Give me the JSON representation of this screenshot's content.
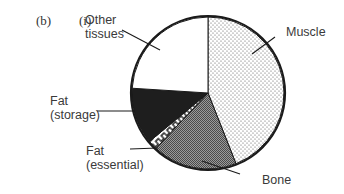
{
  "question": {
    "part": "(b)",
    "subpart": "(i)"
  },
  "labels": {
    "other_tissues_line1": "Other",
    "other_tissues_line2": "tissues",
    "muscle": "Muscle",
    "fat_storage_line1": "Fat",
    "fat_storage_line2": "(storage)",
    "fat_essential_line1": "Fat",
    "fat_essential_line2": "(essential)",
    "bone": "Bone"
  },
  "chart_data": {
    "type": "pie",
    "title": "",
    "start_angle": "12 o'clock, clockwise",
    "categories": [
      "Muscle",
      "Bone",
      "Fat (essential)",
      "Fat (storage)",
      "Other tissues"
    ],
    "values": [
      44,
      18,
      2,
      12,
      24
    ],
    "units": "approximate % of body mass (read from slice angles; no numeric labels shown)",
    "fills": {
      "Muscle": "light stipple (dots on white)",
      "Bone": "dark grey checker/stipple",
      "Fat (essential)": "black-and-white meander pattern",
      "Fat (storage)": "solid near-black",
      "Other tissues": "white"
    },
    "legend": "none (direct leader-line labels)"
  }
}
